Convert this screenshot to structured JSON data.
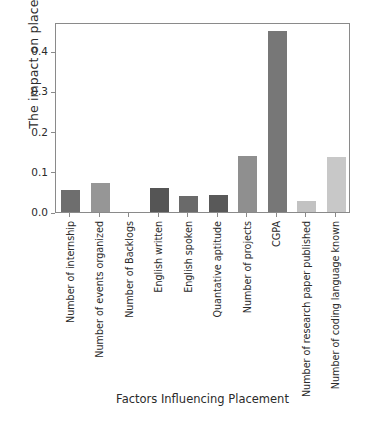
{
  "chart_data": {
    "type": "bar",
    "title": "",
    "xlabel": "Factors Influencing Placement",
    "ylabel": "The impact on placement",
    "categories": [
      "Number of internship",
      "Number of events organized",
      "Number of Backlogs",
      "English written",
      "English spoken",
      "Quantative aptitude",
      "Number of projects",
      "CGPA",
      "Number of research paper published",
      "Number of coding language known"
    ],
    "values": [
      0.055,
      0.073,
      0.0,
      0.06,
      0.039,
      0.042,
      0.14,
      0.449,
      0.028,
      0.138
    ],
    "bar_colors": [
      "#6e6e6e",
      "#969696",
      "#b5b5b5",
      "#555555",
      "#6a6a6a",
      "#595959",
      "#8f8f8f",
      "#777777",
      "#c2c2c2",
      "#c8c8c8"
    ],
    "ylim": [
      0.0,
      0.4725
    ],
    "yticks": [
      0.0,
      0.1,
      0.2,
      0.3,
      0.4
    ],
    "ytick_labels": [
      "0.0",
      "0.1",
      "0.2",
      "0.3",
      "0.4"
    ],
    "grid": false,
    "legend": null,
    "axis_color": "#8a8a8a",
    "text_color": "#2b2b2b",
    "background": "#ffffff"
  },
  "caption": ""
}
